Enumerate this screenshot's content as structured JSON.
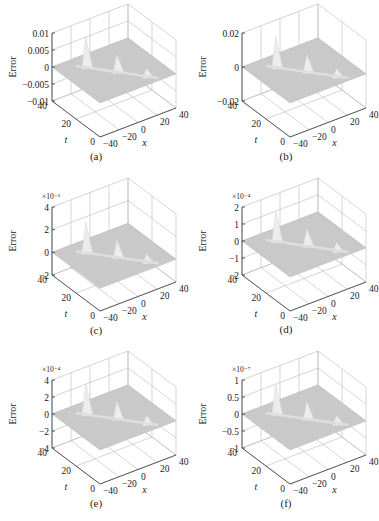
{
  "figure": {
    "panels": [
      {
        "id": "a",
        "caption": "(a)",
        "zlabel": "Error",
        "exponent": "",
        "zticks": [
          "0.01",
          "0.005",
          "0",
          "−0.005",
          "−0.01"
        ],
        "tticks": [
          "40",
          "20",
          "0"
        ],
        "xticks": [
          "−40",
          "−20",
          "0",
          "20",
          "40"
        ],
        "tlabel": "t",
        "xlabel": "x"
      },
      {
        "id": "b",
        "caption": "(b)",
        "zlabel": "Error",
        "exponent": "",
        "zticks": [
          "0.02",
          "0",
          "−0.02"
        ],
        "tticks": [
          "40",
          "20",
          "0"
        ],
        "xticks": [
          "−40",
          "−20",
          "0",
          "20",
          "40"
        ],
        "tlabel": "t",
        "xlabel": "x"
      },
      {
        "id": "c",
        "caption": "(c)",
        "zlabel": "Error",
        "exponent": "×10⁻³",
        "zticks": [
          "4",
          "2",
          "0",
          "−2"
        ],
        "tticks": [
          "40",
          "20",
          "0"
        ],
        "xticks": [
          "−40",
          "−20",
          "0",
          "20",
          "40"
        ],
        "tlabel": "t",
        "xlabel": "x"
      },
      {
        "id": "d",
        "caption": "(d)",
        "zlabel": "Error",
        "exponent": "×10⁻⁴",
        "zticks": [
          "2",
          "1",
          "0",
          "−1",
          "−2"
        ],
        "tticks": [
          "40",
          "20",
          "0"
        ],
        "xticks": [
          "−40",
          "−20",
          "0",
          "20",
          "40"
        ],
        "tlabel": "t",
        "xlabel": "x"
      },
      {
        "id": "e",
        "caption": "(e)",
        "zlabel": "Error",
        "exponent": "×10⁻⁴",
        "zticks": [
          "4",
          "2",
          "0",
          "−2",
          "−4"
        ],
        "tticks": [
          "40",
          "20",
          "0"
        ],
        "xticks": [
          "−40",
          "−20",
          "0",
          "20",
          "40"
        ],
        "tlabel": "t",
        "xlabel": "x"
      },
      {
        "id": "f",
        "caption": "(f)",
        "zlabel": "Error",
        "exponent": "×10⁻⁷",
        "zticks": [
          "1",
          "0.5",
          "0",
          "−0.5",
          "−1"
        ],
        "tticks": [
          "40",
          "20",
          "0"
        ],
        "xticks": [
          "−40",
          "−20",
          "0",
          "20",
          "40"
        ],
        "tlabel": "t",
        "xlabel": "x"
      }
    ]
  },
  "chart_data": [
    {
      "type": "surface3d",
      "panel": "(a)",
      "zlabel": "Error",
      "xlabel": "x",
      "ylabel": "t",
      "xlim": [
        -40,
        40
      ],
      "ylim": [
        0,
        40
      ],
      "zlim": [
        -0.01,
        0.01
      ],
      "zticks": [
        0.01,
        0.005,
        0,
        -0.005,
        -0.01
      ],
      "xticks": [
        -40,
        -20,
        0,
        20,
        40
      ],
      "yticks": [
        0,
        20,
        40
      ],
      "grid": true,
      "peaks_approx": [
        0.009,
        0.004,
        0.0015
      ]
    },
    {
      "type": "surface3d",
      "panel": "(b)",
      "zlabel": "Error",
      "xlabel": "x",
      "ylabel": "t",
      "xlim": [
        -40,
        40
      ],
      "ylim": [
        0,
        40
      ],
      "zlim": [
        -0.03,
        0.03
      ],
      "zticks": [
        0.02,
        0,
        -0.02
      ],
      "xticks": [
        -40,
        -20,
        0,
        20,
        40
      ],
      "yticks": [
        0,
        20,
        40
      ],
      "grid": true,
      "peaks_approx": [
        0.025,
        0.01,
        0.004
      ]
    },
    {
      "type": "surface3d",
      "panel": "(c)",
      "zlabel": "Error",
      "scale": "1e-3",
      "xlabel": "x",
      "ylabel": "t",
      "xlim": [
        -40,
        40
      ],
      "ylim": [
        0,
        40
      ],
      "zlim": [
        -2,
        4
      ],
      "zticks": [
        4,
        2,
        0,
        -2
      ],
      "xticks": [
        -40,
        -20,
        0,
        20,
        40
      ],
      "yticks": [
        0,
        20,
        40
      ],
      "grid": true,
      "peaks_approx": [
        2.8,
        0.8,
        0.3
      ]
    },
    {
      "type": "surface3d",
      "panel": "(d)",
      "zlabel": "Error",
      "scale": "1e-4",
      "xlabel": "x",
      "ylabel": "t",
      "xlim": [
        -40,
        40
      ],
      "ylim": [
        0,
        40
      ],
      "zlim": [
        -2,
        2
      ],
      "zticks": [
        2,
        1,
        0,
        -1,
        -2
      ],
      "xticks": [
        -40,
        -20,
        0,
        20,
        40
      ],
      "yticks": [
        0,
        20,
        40
      ],
      "grid": true,
      "peaks_approx": [
        1.6,
        0.8,
        0.3
      ]
    },
    {
      "type": "surface3d",
      "panel": "(e)",
      "zlabel": "Error",
      "scale": "1e-4",
      "xlabel": "x",
      "ylabel": "t",
      "xlim": [
        -40,
        40
      ],
      "ylim": [
        0,
        40
      ],
      "zlim": [
        -4,
        4
      ],
      "zticks": [
        4,
        2,
        0,
        -2,
        -4
      ],
      "xticks": [
        -40,
        -20,
        0,
        20,
        40
      ],
      "yticks": [
        0,
        20,
        40
      ],
      "grid": true,
      "peaks_approx": [
        3.5,
        1.4,
        0.5
      ]
    },
    {
      "type": "surface3d",
      "panel": "(f)",
      "zlabel": "Error",
      "scale": "1e-7",
      "xlabel": "x",
      "ylabel": "t",
      "xlim": [
        -40,
        40
      ],
      "ylim": [
        0,
        40
      ],
      "zlim": [
        -1,
        1
      ],
      "zticks": [
        1,
        0.5,
        0,
        -0.5,
        -1
      ],
      "xticks": [
        -40,
        -20,
        0,
        20,
        40
      ],
      "yticks": [
        0,
        20,
        40
      ],
      "grid": true,
      "peaks_approx": [
        0.9,
        0.5,
        0.2
      ]
    }
  ]
}
